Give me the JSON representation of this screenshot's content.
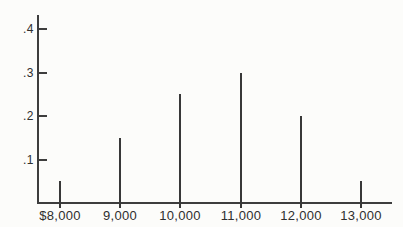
{
  "chart_data": {
    "type": "bar",
    "subtype": "spike-pmf",
    "categories": [
      "$8,000",
      "9,000",
      "10,000",
      "11,000",
      "12,000",
      "13,000"
    ],
    "values": [
      0.05,
      0.15,
      0.25,
      0.3,
      0.2,
      0.05
    ],
    "title": "",
    "xlabel": "",
    "ylabel": "",
    "ylim": [
      0,
      0.43
    ],
    "yticks": [
      0.1,
      0.2,
      0.3,
      0.4
    ],
    "ytick_labels": [
      ".1",
      ".2",
      ".3",
      ".4"
    ],
    "grid": false,
    "legend": false,
    "line_color": "#3d3d3d",
    "text_color": "#2e2e2e",
    "background_color": "#fcfcfa"
  }
}
